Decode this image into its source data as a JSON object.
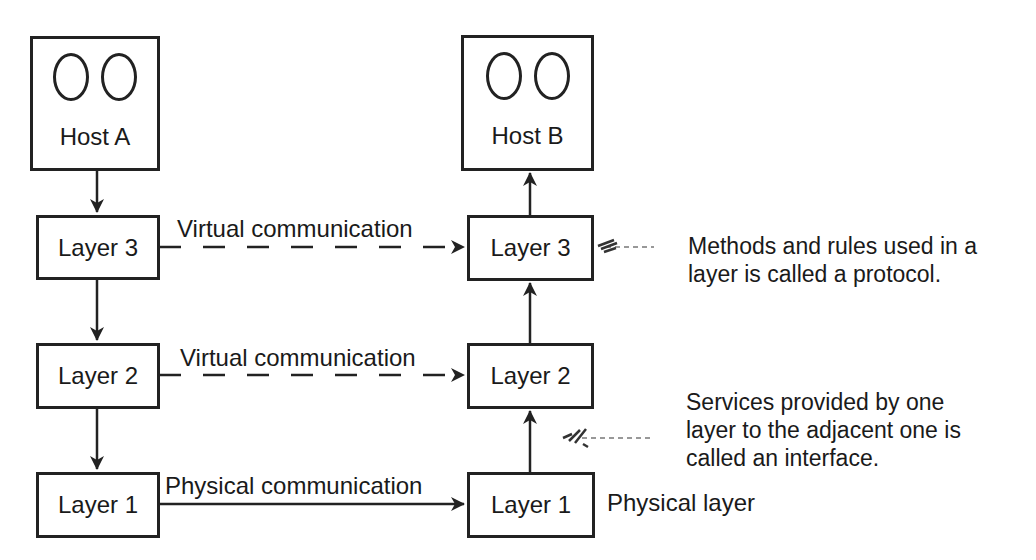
{
  "diagram": {
    "type": "layered-network-model",
    "colors": {
      "stroke": "#222222",
      "text": "#1a1a1a",
      "background": "#ffffff"
    },
    "hosts": [
      {
        "id": "host-a",
        "label": "Host A",
        "icon": "terminal-ovals"
      },
      {
        "id": "host-b",
        "label": "Host B",
        "icon": "terminal-ovals"
      }
    ],
    "left_stack": {
      "layer3": "Layer 3",
      "layer2": "Layer 2",
      "layer1": "Layer 1"
    },
    "right_stack": {
      "layer3": "Layer 3",
      "layer2": "Layer 2",
      "layer1": "Layer 1"
    },
    "links": {
      "layer3": {
        "label": "Virtual communication",
        "style": "dashed"
      },
      "layer2": {
        "label": "Virtual communication",
        "style": "dashed"
      },
      "layer1": {
        "label": "Physical communication",
        "style": "solid"
      }
    },
    "physical_layer_label": "Physical layer",
    "notes": {
      "protocol": {
        "line1": "Methods and rules used in a",
        "line2": "layer is called a protocol."
      },
      "interface": {
        "line1": "Services provided by one",
        "line2": "layer to the adjacent one is",
        "line3": "called an interface."
      }
    }
  }
}
